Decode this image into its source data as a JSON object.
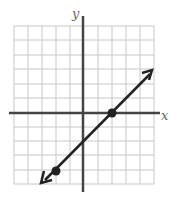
{
  "graph": {
    "x_axis_label": "x",
    "y_axis_label": "y",
    "grid": {
      "cols": 10,
      "rows": 11,
      "x_min": -5,
      "x_max": 5,
      "y_min": -6,
      "y_max": 5
    },
    "line": {
      "equation": "y = x - 2",
      "slope": 1,
      "y_intercept": -2,
      "arrows": "both"
    },
    "points": [
      {
        "x": 2,
        "y": 0
      },
      {
        "x": -2,
        "y": -4
      }
    ],
    "colors": {
      "grid": "#c8c8c8",
      "axis": "#444444",
      "line": "#222222"
    }
  }
}
